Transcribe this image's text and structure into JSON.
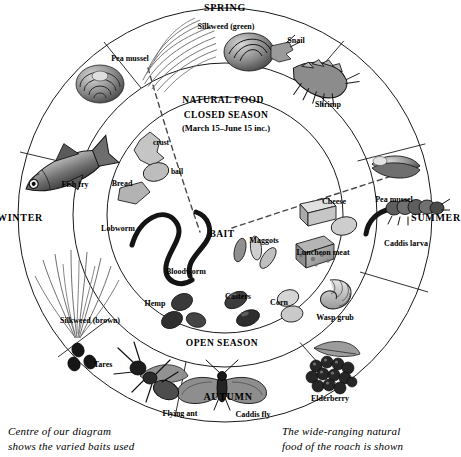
{
  "diagram": {
    "center": {
      "bait_label": "BAIT",
      "closed_season_line1": "CLOSED SEASON",
      "closed_season_line2": "(March 15–June 15 inc.)",
      "open_season": "OPEN SEASON"
    },
    "outer_ring_label": "NATURAL FOOD",
    "seasons": [
      {
        "name": "SPRING",
        "position": "top"
      },
      {
        "name": "SUMMER",
        "position": "right"
      },
      {
        "name": "AUTUMN",
        "position": "bottom"
      },
      {
        "name": "WINTER",
        "position": "left"
      }
    ],
    "natural_food": [
      {
        "label": "Pea mussel",
        "season": "SPRING"
      },
      {
        "label": "Silkweed (green)",
        "season": "SPRING"
      },
      {
        "label": "Snail",
        "season": "SPRING"
      },
      {
        "label": "Shrimp",
        "season": "SPRING"
      },
      {
        "label": "Pea mussel",
        "season": "SUMMER"
      },
      {
        "label": "Caddis larva",
        "season": "SUMMER"
      },
      {
        "label": "Wasp grub",
        "season": "SUMMER"
      },
      {
        "label": "Elderberry",
        "season": "AUTUMN"
      },
      {
        "label": "Caddis fly",
        "season": "AUTUMN"
      },
      {
        "label": "Flying ant",
        "season": "AUTUMN"
      },
      {
        "label": "Tares",
        "season": "AUTUMN"
      },
      {
        "label": "Silkweed (brown)",
        "season": "WINTER"
      },
      {
        "label": "Fish fry",
        "season": "WINTER"
      }
    ],
    "baits": [
      {
        "label": "crust"
      },
      {
        "label": "ball"
      },
      {
        "label": "Bread"
      },
      {
        "label": "Lobworm"
      },
      {
        "label": "Bloodworm"
      },
      {
        "label": "Maggots"
      },
      {
        "label": "Cheese"
      },
      {
        "label": "Luncheon meat"
      },
      {
        "label": "Corn"
      },
      {
        "label": "Casters"
      },
      {
        "label": "Hemp"
      }
    ],
    "captions": {
      "left_line1": "Centre of our diagram",
      "left_line2": "shows the varied baits used",
      "right_line1": "The wide-ranging natural",
      "right_line2": "food of the roach is shown"
    },
    "colors": {
      "ink": "#000000",
      "background": "#ffffff",
      "line": "#1a1a1a",
      "art_dark": "#3b3b3b",
      "art_mid": "#7d7d7d",
      "art_light": "#c2c2c2"
    }
  }
}
